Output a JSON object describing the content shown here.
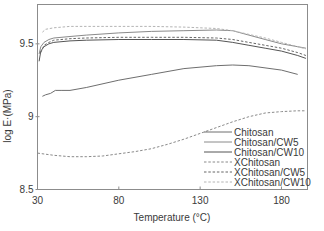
{
  "chart_data": {
    "type": "line",
    "title": "",
    "xlabel": "Temperature (°C)",
    "ylabel": "log E·(MPa)",
    "xlim": [
      30,
      196
    ],
    "ylim": [
      8.5,
      9.77
    ],
    "xticks": [
      30,
      80,
      130,
      180
    ],
    "yticks": [
      8.5,
      9,
      9.5
    ],
    "xtick_labels": [
      "30",
      "80",
      "130",
      "180"
    ],
    "ytick_labels": [
      "8.5",
      "9",
      "9.5"
    ],
    "grid": false,
    "legend_position": "lower right",
    "series": [
      {
        "name": "Chitosan",
        "style": "solid",
        "color": "#6e6e6e",
        "x": [
          33,
          35,
          38,
          41,
          45,
          50,
          60,
          80,
          100,
          120,
          140,
          150,
          160,
          180,
          190
        ],
        "y": [
          9.14,
          9.15,
          9.16,
          9.18,
          9.18,
          9.18,
          9.2,
          9.25,
          9.29,
          9.33,
          9.35,
          9.355,
          9.35,
          9.32,
          9.29
        ]
      },
      {
        "name": "Chitosan/CW5",
        "style": "solid",
        "color": "#8a8a8a",
        "x": [
          31,
          32,
          34,
          37,
          40,
          50,
          60,
          80,
          100,
          120,
          140,
          150,
          160,
          170,
          180,
          190,
          195
        ],
        "y": [
          9.43,
          9.48,
          9.51,
          9.53,
          9.54,
          9.55,
          9.56,
          9.575,
          9.585,
          9.59,
          9.595,
          9.59,
          9.56,
          9.53,
          9.5,
          9.48,
          9.47
        ]
      },
      {
        "name": "Chitosan/CW10",
        "style": "solid",
        "color": "#555555",
        "x": [
          31,
          32,
          34,
          37,
          40,
          50,
          60,
          80,
          100,
          120,
          140,
          150,
          160,
          170,
          180,
          190,
          195
        ],
        "y": [
          9.38,
          9.45,
          9.48,
          9.5,
          9.51,
          9.52,
          9.525,
          9.53,
          9.53,
          9.53,
          9.525,
          9.51,
          9.49,
          9.47,
          9.45,
          9.42,
          9.4
        ]
      },
      {
        "name": "XChitosan",
        "style": "dashed",
        "color": "#8a8a8a",
        "x": [
          30,
          40,
          50,
          60,
          70,
          80,
          90,
          100,
          110,
          120,
          130,
          140,
          150,
          160,
          170,
          180,
          190,
          195
        ],
        "y": [
          8.75,
          8.735,
          8.725,
          8.725,
          8.73,
          8.745,
          8.76,
          8.78,
          8.81,
          8.845,
          8.885,
          8.925,
          8.965,
          9.0,
          9.025,
          9.035,
          9.04,
          9.04
        ]
      },
      {
        "name": "XChitosan/CW5",
        "style": "dashed",
        "color": "#666666",
        "x": [
          32,
          34,
          37,
          40,
          50,
          60,
          80,
          100,
          120,
          140,
          150,
          160,
          170,
          180,
          190,
          195
        ],
        "y": [
          9.44,
          9.49,
          9.51,
          9.525,
          9.535,
          9.54,
          9.545,
          9.545,
          9.545,
          9.54,
          9.53,
          9.51,
          9.49,
          9.47,
          9.44,
          9.42
        ]
      },
      {
        "name": "XChitosan/CW10",
        "style": "dashed",
        "color": "#b4b4b4",
        "x": [
          33,
          35,
          40,
          50,
          60,
          80,
          100,
          120,
          140,
          150,
          160,
          170,
          180,
          190,
          195
        ],
        "y": [
          9.58,
          9.6,
          9.61,
          9.62,
          9.62,
          9.62,
          9.62,
          9.615,
          9.605,
          9.59,
          9.565,
          9.54,
          9.51,
          9.48,
          9.465
        ]
      }
    ]
  }
}
